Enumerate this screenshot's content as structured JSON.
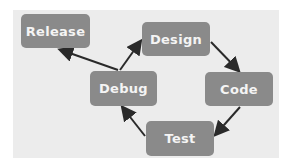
{
  "diagram": {
    "type": "cycle",
    "colors": {
      "background": "#ececec",
      "node": "#8a8a8a",
      "text": "#f4f4f4",
      "arrow": "#2a2a2a"
    },
    "nodes": [
      {
        "id": "release",
        "label": "Release"
      },
      {
        "id": "design",
        "label": "Design"
      },
      {
        "id": "code",
        "label": "Code"
      },
      {
        "id": "test",
        "label": "Test"
      },
      {
        "id": "debug",
        "label": "Debug"
      }
    ],
    "edges": [
      {
        "from": "design",
        "to": "code"
      },
      {
        "from": "code",
        "to": "test"
      },
      {
        "from": "test",
        "to": "debug"
      },
      {
        "from": "debug",
        "to": "design"
      },
      {
        "from": "debug",
        "to": "release"
      }
    ]
  }
}
